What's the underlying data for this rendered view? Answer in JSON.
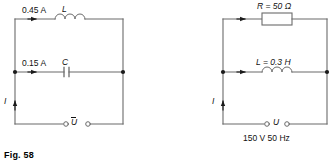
{
  "figure": {
    "caption": "Fig. 58",
    "background_color": "#ffffff",
    "line_color": "#5a5a5a",
    "text_color": "#111111"
  },
  "circuits": [
    {
      "id": "left-circuit",
      "name": "parallel-LC-circuit",
      "branches": [
        {
          "name": "inductor-branch",
          "current_label": "0.45 A",
          "component_label": "L",
          "component_type": "inductor",
          "arrow": "right"
        },
        {
          "name": "capacitor-branch",
          "current_label": "0.15 A",
          "component_label": "C",
          "component_type": "capacitor",
          "arrow": "right"
        }
      ],
      "source": {
        "name": "voltage-source-terminals",
        "label": "U",
        "overbar": true,
        "terminal_count": 2
      },
      "total_current_label": "I",
      "total_current_arrow": "up"
    },
    {
      "id": "right-circuit",
      "name": "parallel-RL-circuit",
      "branches": [
        {
          "name": "resistor-branch",
          "current_label": "",
          "component_label": "R = 50 Ω",
          "component_type": "resistor",
          "arrow": "right"
        },
        {
          "name": "inductor-branch",
          "current_label": "",
          "component_label": "L = 0.3 H",
          "component_type": "inductor",
          "arrow": "right"
        }
      ],
      "source": {
        "name": "voltage-source-terminals",
        "label": "U",
        "overbar": false,
        "terminal_count": 2,
        "rating": "150 V 50 Hz"
      },
      "total_current_label": "I",
      "total_current_arrow": "up"
    }
  ]
}
